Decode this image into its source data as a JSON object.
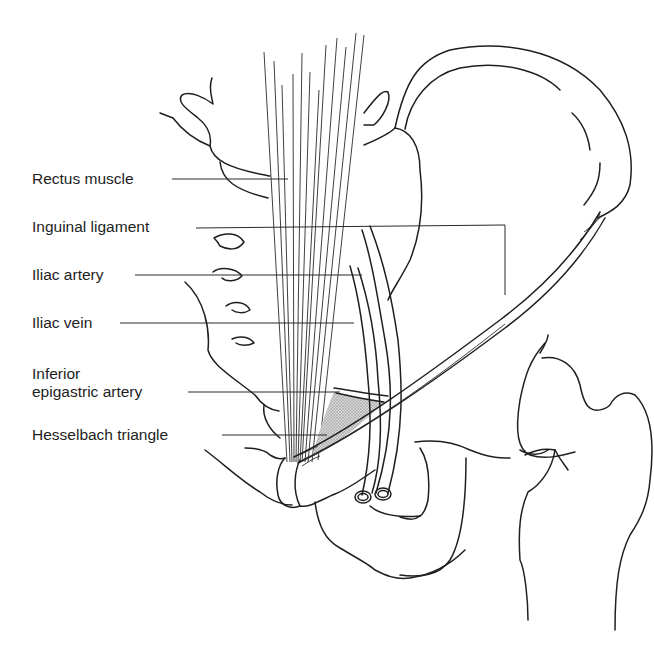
{
  "figure": {
    "shaded_region_color": "#bdbdbd",
    "line_color": "#1f1f1f"
  },
  "labels": [
    {
      "id": "rectus-muscle",
      "text": "Rectus muscle"
    },
    {
      "id": "inguinal-ligament",
      "text": "Inguinal ligament"
    },
    {
      "id": "iliac-artery",
      "text": "Iliac artery"
    },
    {
      "id": "iliac-vein",
      "text": "Iliac vein"
    },
    {
      "id": "inferior-epigastric-artery",
      "line1": "Inferior",
      "line2": "epigastric artery"
    },
    {
      "id": "hesselbach-triangle",
      "text": "Hesselbach triangle"
    }
  ]
}
